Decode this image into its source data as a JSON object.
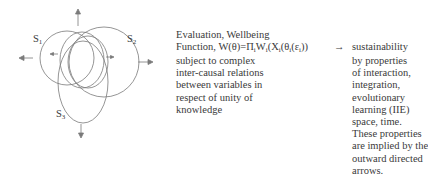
{
  "diagram": {
    "labels": {
      "s1": "S",
      "s1_sub": "1",
      "s2": "S",
      "s2_sub": "2",
      "s3": "S",
      "s3_sub": "3"
    },
    "arrows": [
      "up",
      "left",
      "right",
      "down"
    ],
    "stroke_color": "#7a7a7a"
  },
  "middle": {
    "title_line1": "Evaluation, Wellbeing",
    "title_line2_prefix": "Function, W(θ)=Π",
    "formula_parts": [
      "i",
      "W",
      "i",
      "(X",
      "i",
      "(θ",
      "i",
      "(ε",
      "i",
      "))"
    ],
    "body_lines": [
      "subject to complex",
      "inter-causal relations",
      "between variables in",
      "respect of unity of",
      "knowledge"
    ]
  },
  "arrow_symbol": "→",
  "right": {
    "title": "sustainability",
    "body_lines": [
      "by properties",
      "of interaction,",
      "integration,",
      "evolutionary",
      "learning (IIE)",
      "space, time.",
      "These properties",
      "are implied by the",
      "outward directed",
      "arrows."
    ]
  }
}
